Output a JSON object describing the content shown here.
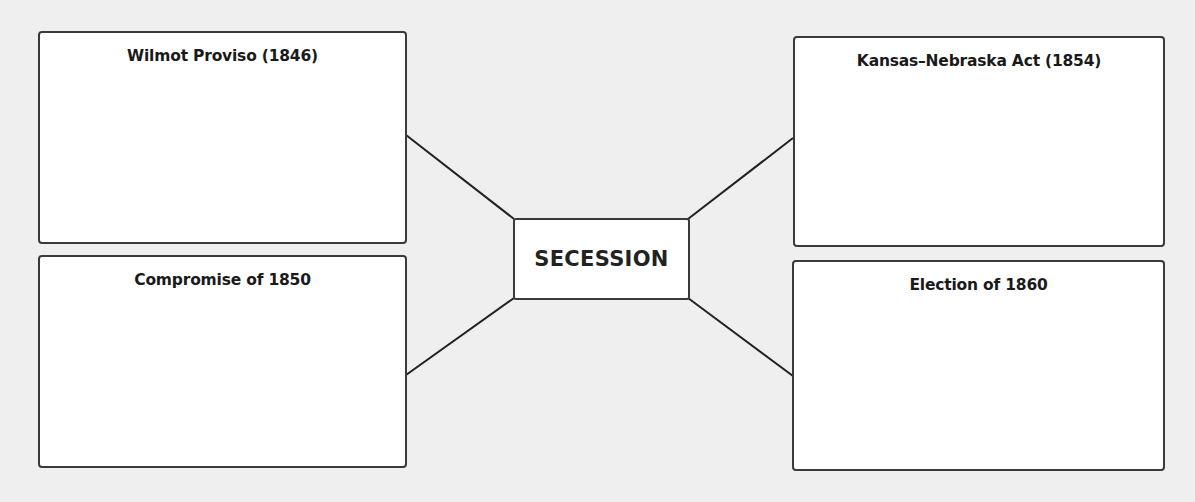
{
  "diagram": {
    "type": "concept-web",
    "center": {
      "label": "SECESSION"
    },
    "boxes": [
      {
        "id": "top-left",
        "title": "Wilmot Proviso (1846)",
        "content": ""
      },
      {
        "id": "bottom-left",
        "title": "Compromise of 1850",
        "content": ""
      },
      {
        "id": "top-right",
        "title": "Kansas–Nebraska Act (1854)",
        "content": ""
      },
      {
        "id": "bottom-right",
        "title": "Election of 1860",
        "content": ""
      }
    ]
  },
  "colors": {
    "background": "#efefef",
    "box_fill": "#ffffff",
    "border": "#3a3a3a",
    "text": "#1a1a1a"
  }
}
